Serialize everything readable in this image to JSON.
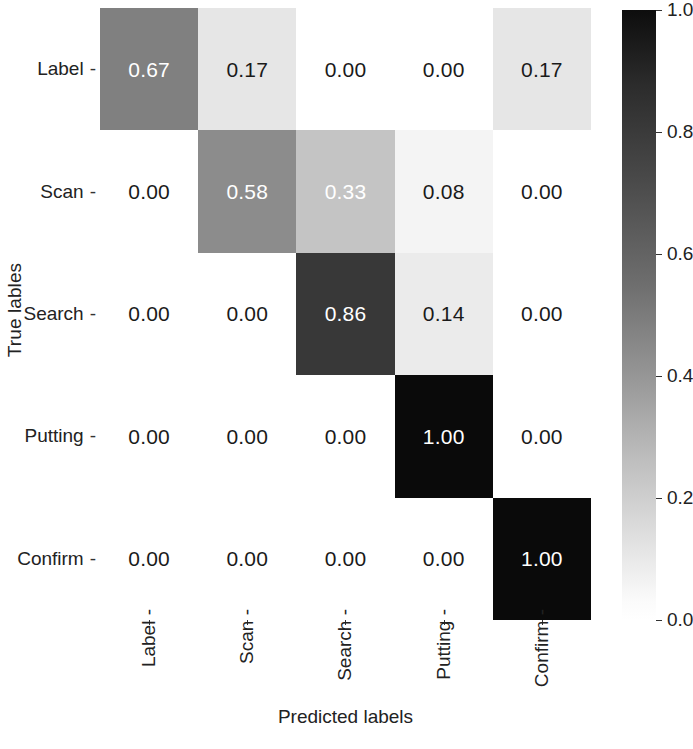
{
  "chart_data": {
    "type": "heatmap",
    "title": "",
    "subtitle": "",
    "xlabel": "Predicted labels",
    "ylabel": "True lables",
    "categories": [
      "Label",
      "Scan",
      "Search",
      "Putting",
      "Confirm"
    ],
    "row_labels": [
      "Label",
      "Scan",
      "Search",
      "Putting",
      "Confirm"
    ],
    "col_labels": [
      "Label",
      "Scan",
      "Search",
      "Putting",
      "Confirm"
    ],
    "grid": false,
    "colormap": "Greys",
    "colormap_reversed": false,
    "zlim": [
      0.0,
      1.0
    ],
    "colorbar": {
      "position": "right",
      "orientation": "vertical",
      "ticks": [
        1.0,
        0.8,
        0.6,
        0.4,
        0.2,
        0.0
      ],
      "tick_labels": [
        "1.0",
        "0.8",
        "0.6",
        "0.4",
        "0.2",
        "0.0"
      ],
      "vmin": 0.0,
      "vmax": 1.0,
      "low_color": "#ffffff",
      "high_color": "#000000"
    },
    "matrix": [
      [
        0.67,
        0.17,
        0.0,
        0.0,
        0.17
      ],
      [
        0.0,
        0.58,
        0.33,
        0.08,
        0.0
      ],
      [
        0.0,
        0.0,
        0.86,
        0.14,
        0.0
      ],
      [
        0.0,
        0.0,
        0.0,
        1.0,
        0.0
      ],
      [
        0.0,
        0.0,
        0.0,
        0.0,
        1.0
      ]
    ],
    "cells": [
      [
        {
          "text": "0.67",
          "value": 0.67,
          "bg": "#808080",
          "fg": "#ffffff"
        },
        {
          "text": "0.17",
          "value": 0.17,
          "bg": "#e6e6e6",
          "fg": "#1a1a1a"
        },
        {
          "text": "0.00",
          "value": 0.0,
          "bg": "#ffffff",
          "fg": "#1a1a1a"
        },
        {
          "text": "0.00",
          "value": 0.0,
          "bg": "#ffffff",
          "fg": "#1a1a1a"
        },
        {
          "text": "0.17",
          "value": 0.17,
          "bg": "#e6e6e6",
          "fg": "#1a1a1a"
        }
      ],
      [
        {
          "text": "0.00",
          "value": 0.0,
          "bg": "#ffffff",
          "fg": "#1a1a1a"
        },
        {
          "text": "0.58",
          "value": 0.58,
          "bg": "#8c8c8c",
          "fg": "#ffffff"
        },
        {
          "text": "0.33",
          "value": 0.33,
          "bg": "#c4c4c4",
          "fg": "#ffffff"
        },
        {
          "text": "0.08",
          "value": 0.08,
          "bg": "#f4f4f4",
          "fg": "#1a1a1a"
        },
        {
          "text": "0.00",
          "value": 0.0,
          "bg": "#ffffff",
          "fg": "#1a1a1a"
        }
      ],
      [
        {
          "text": "0.00",
          "value": 0.0,
          "bg": "#ffffff",
          "fg": "#1a1a1a"
        },
        {
          "text": "0.00",
          "value": 0.0,
          "bg": "#ffffff",
          "fg": "#1a1a1a"
        },
        {
          "text": "0.86",
          "value": 0.86,
          "bg": "#383838",
          "fg": "#ffffff"
        },
        {
          "text": "0.14",
          "value": 0.14,
          "bg": "#ebebeb",
          "fg": "#1a1a1a"
        },
        {
          "text": "0.00",
          "value": 0.0,
          "bg": "#ffffff",
          "fg": "#1a1a1a"
        }
      ],
      [
        {
          "text": "0.00",
          "value": 0.0,
          "bg": "#ffffff",
          "fg": "#1a1a1a"
        },
        {
          "text": "0.00",
          "value": 0.0,
          "bg": "#ffffff",
          "fg": "#1a1a1a"
        },
        {
          "text": "0.00",
          "value": 0.0,
          "bg": "#ffffff",
          "fg": "#1a1a1a"
        },
        {
          "text": "1.00",
          "value": 1.0,
          "bg": "#0a0a0a",
          "fg": "#ffffff"
        },
        {
          "text": "0.00",
          "value": 0.0,
          "bg": "#ffffff",
          "fg": "#1a1a1a"
        }
      ],
      [
        {
          "text": "0.00",
          "value": 0.0,
          "bg": "#ffffff",
          "fg": "#1a1a1a"
        },
        {
          "text": "0.00",
          "value": 0.0,
          "bg": "#ffffff",
          "fg": "#1a1a1a"
        },
        {
          "text": "0.00",
          "value": 0.0,
          "bg": "#ffffff",
          "fg": "#1a1a1a"
        },
        {
          "text": "0.00",
          "value": 0.0,
          "bg": "#ffffff",
          "fg": "#1a1a1a"
        },
        {
          "text": "1.00",
          "value": 1.0,
          "bg": "#0a0a0a",
          "fg": "#ffffff"
        }
      ]
    ]
  },
  "axes": {
    "y_title": "True lables",
    "x_title": "Predicted labels",
    "y_tick_suffix": "-",
    "x_tick_suffix": "-"
  }
}
